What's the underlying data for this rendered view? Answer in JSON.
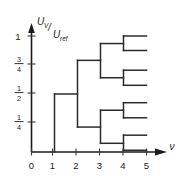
{
  "figure": {
    "title": "",
    "y_axis": {
      "label_numerator": "U",
      "label_numerator_sub": "V",
      "label_denominator": "U",
      "label_denominator_sub": "ref",
      "label_slash": "/",
      "ticks": [
        {
          "value": 1,
          "text": "1",
          "numer": "1",
          "denom": "",
          "is_fraction": false
        },
        {
          "value": 0.75,
          "text": "3/4",
          "numer": "3",
          "denom": "4",
          "is_fraction": true
        },
        {
          "value": 0.5,
          "text": "1/2",
          "numer": "1",
          "denom": "2",
          "is_fraction": true
        },
        {
          "value": 0.25,
          "text": "1/4",
          "numer": "1",
          "denom": "4",
          "is_fraction": true
        }
      ]
    },
    "x_axis": {
      "label": "ν",
      "ticks": [
        "0",
        "1",
        "2",
        "3",
        "4",
        "5"
      ]
    },
    "colors": {
      "axis": "#1a1a1a",
      "tree": "#2b2b2b",
      "background": "#ffffff"
    }
  },
  "chart_data": {
    "type": "line",
    "title": "",
    "xlabel": "ν",
    "ylabel": "U_V/U_ref",
    "xlim": [
      0,
      5.6
    ],
    "ylim": [
      0,
      1.08
    ],
    "xticks": [
      0,
      1,
      2,
      3,
      4,
      5
    ],
    "xticklabels": [
      "0",
      "1",
      "2",
      "3",
      "4",
      "5"
    ],
    "yticks": [
      0.25,
      0.5,
      0.75,
      1
    ],
    "yticklabels": [
      "1/4",
      "1/2",
      "3/4",
      "1"
    ],
    "grid": false,
    "legend": null,
    "series": [
      {
        "name": "trunk-riser",
        "points": [
          [
            1,
            0
          ],
          [
            1,
            0.5
          ]
        ]
      },
      {
        "name": "trunk-stem",
        "points": [
          [
            1,
            0.5
          ],
          [
            2,
            0.5
          ]
        ]
      },
      {
        "name": "split-1-vertical",
        "points": [
          [
            2,
            0.215
          ],
          [
            2,
            0.79
          ]
        ]
      },
      {
        "name": "branch-upper-stem",
        "points": [
          [
            2,
            0.79
          ],
          [
            3,
            0.79
          ]
        ]
      },
      {
        "name": "branch-lower-stem",
        "points": [
          [
            2,
            0.215
          ],
          [
            3,
            0.215
          ]
        ]
      },
      {
        "name": "split-2-upper-vertical",
        "points": [
          [
            3,
            0.64
          ],
          [
            3,
            0.935
          ]
        ]
      },
      {
        "name": "split-2-lower-vertical",
        "points": [
          [
            3,
            0.075
          ],
          [
            3,
            0.36
          ]
        ]
      },
      {
        "name": "stem-3a",
        "points": [
          [
            3,
            0.935
          ],
          [
            4,
            0.935
          ]
        ]
      },
      {
        "name": "stem-3b",
        "points": [
          [
            3,
            0.64
          ],
          [
            4,
            0.64
          ]
        ]
      },
      {
        "name": "stem-3c",
        "points": [
          [
            3,
            0.36
          ],
          [
            4,
            0.36
          ]
        ]
      },
      {
        "name": "stem-3d",
        "points": [
          [
            3,
            0.075
          ],
          [
            4,
            0.075
          ]
        ]
      },
      {
        "name": "split-3a-vertical",
        "points": [
          [
            4,
            0.875
          ],
          [
            4,
            1.0
          ]
        ]
      },
      {
        "name": "split-3b-vertical",
        "points": [
          [
            4,
            0.575
          ],
          [
            4,
            0.705
          ]
        ]
      },
      {
        "name": "split-3c-vertical",
        "points": [
          [
            4,
            0.295
          ],
          [
            4,
            0.425
          ]
        ]
      },
      {
        "name": "split-3d-vertical",
        "points": [
          [
            4,
            0.015
          ],
          [
            4,
            0.145
          ]
        ]
      },
      {
        "name": "leaf-1",
        "points": [
          [
            4,
            1.0
          ],
          [
            5,
            1.0
          ]
        ]
      },
      {
        "name": "leaf-2",
        "points": [
          [
            4,
            0.875
          ],
          [
            5,
            0.875
          ]
        ]
      },
      {
        "name": "leaf-3",
        "points": [
          [
            4,
            0.705
          ],
          [
            5,
            0.705
          ]
        ]
      },
      {
        "name": "leaf-4",
        "points": [
          [
            4,
            0.575
          ],
          [
            5,
            0.575
          ]
        ]
      },
      {
        "name": "leaf-5",
        "points": [
          [
            4,
            0.425
          ],
          [
            5,
            0.425
          ]
        ]
      },
      {
        "name": "leaf-6",
        "points": [
          [
            4,
            0.295
          ],
          [
            5,
            0.295
          ]
        ]
      },
      {
        "name": "leaf-7",
        "points": [
          [
            4,
            0.145
          ],
          [
            5,
            0.145
          ]
        ]
      },
      {
        "name": "leaf-8",
        "points": [
          [
            4,
            0.015
          ],
          [
            5,
            0.015
          ]
        ]
      }
    ]
  }
}
